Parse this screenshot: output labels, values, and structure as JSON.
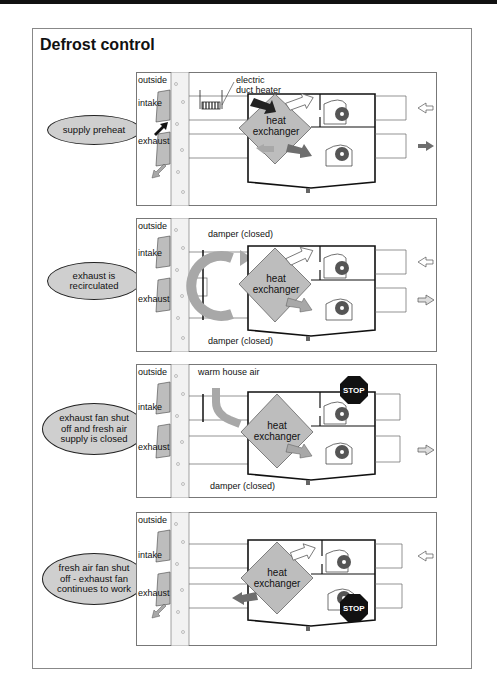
{
  "title": "Defrost control",
  "common": {
    "outside": "outside",
    "intake": "intake",
    "exhaust": "exhaust",
    "heat_exchanger": "heat\nexchanger",
    "stop": "STOP"
  },
  "panels": [
    {
      "mode": "supply preheat",
      "callouts": [
        "electric\nduct heater"
      ]
    },
    {
      "mode": "exhaust is\nrecirculated",
      "callouts": [
        "damper (closed)",
        "damper (closed)"
      ]
    },
    {
      "mode": "exhaust fan shut\noff and fresh air\nsupply is closed",
      "callouts": [
        "warm house air",
        "damper (closed)"
      ]
    },
    {
      "mode": "fresh air fan shut\noff - exhaust fan\ncontinues to work",
      "callouts": []
    }
  ],
  "colors": {
    "exchanger_fill": "#bdbdbd",
    "wall_fill": "#f2f2f2",
    "arrow_dark": "#222222",
    "arrow_mid": "#6e6e6e",
    "arrow_light": "#a8a8a8",
    "fan_ring": "#555555",
    "oval_fill": "#cfcfcf"
  }
}
